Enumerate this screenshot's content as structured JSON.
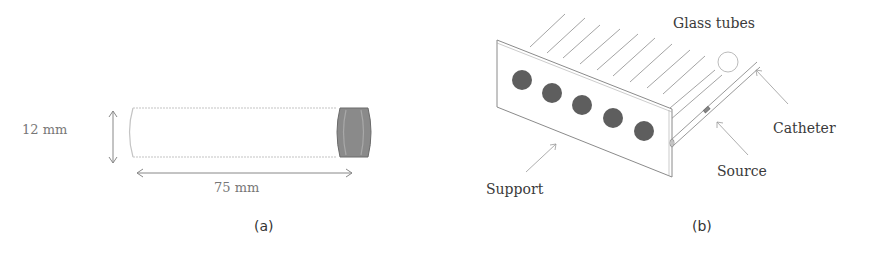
{
  "panel_a": {
    "caption": "(a)",
    "height_label": "12 mm",
    "length_label": "75 mm",
    "tube": {
      "outline_color": "#bbbbbb",
      "cap_color": "#7a7a7a"
    }
  },
  "panel_b": {
    "caption": "(b)",
    "labels": {
      "glass_tubes": "Glass tubes",
      "catheter": "Catheter",
      "source": "Source",
      "support": "Support"
    },
    "circles_count": 5,
    "circle_color": "#5e5e5e"
  }
}
